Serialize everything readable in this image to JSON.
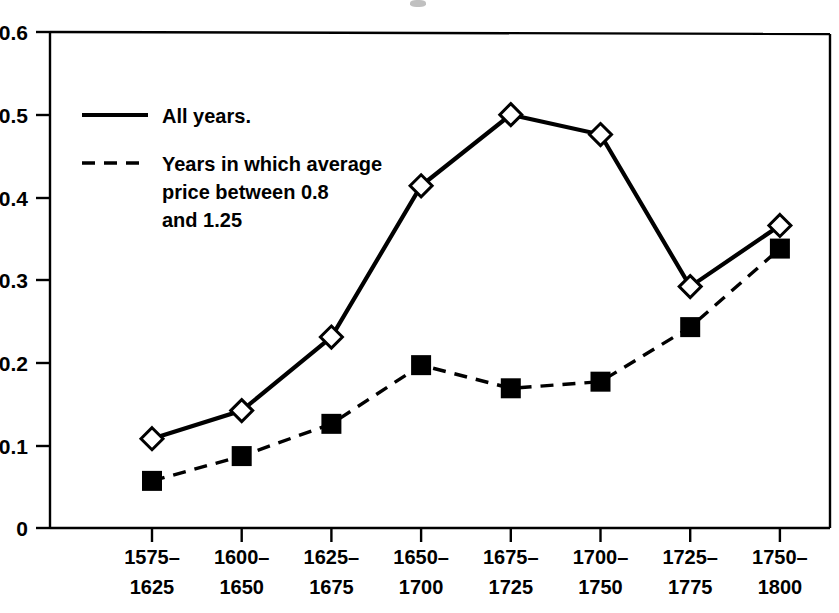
{
  "chart_data": {
    "type": "line",
    "title": "",
    "xlabel": "",
    "ylabel": "",
    "categories": [
      "1575–1625",
      "1600–1650",
      "1625–1675",
      "1650–1700",
      "1675–1725",
      "1700–1750",
      "1725–1775",
      "1750–1800"
    ],
    "category_lines": [
      [
        "1575–",
        "1625"
      ],
      [
        "1600–",
        "1650"
      ],
      [
        "1625–",
        "1675"
      ],
      [
        "1650–",
        "1700"
      ],
      [
        "1675–",
        "1725"
      ],
      [
        "1700–",
        "1750"
      ],
      [
        "1725–",
        "1775"
      ],
      [
        "1750–",
        "1800"
      ]
    ],
    "series": [
      {
        "name": "All years.",
        "linestyle": "solid",
        "marker": "open-diamond",
        "color": "#000000",
        "values": [
          0.108,
          0.142,
          0.231,
          0.414,
          0.5,
          0.476,
          0.292,
          0.366
        ]
      },
      {
        "name": "Years in which average price between 0.8 and 1.25",
        "linestyle": "dashed",
        "marker": "filled-square",
        "color": "#000000",
        "values": [
          0.057,
          0.087,
          0.126,
          0.197,
          0.169,
          0.177,
          0.243,
          0.338
        ]
      }
    ],
    "ylim": [
      0,
      0.6
    ],
    "yticks": [
      0,
      0.1,
      0.2,
      0.3,
      0.4,
      0.5,
      0.6
    ],
    "ytick_labels": [
      "0",
      "0.1",
      "0.2",
      "0.3",
      "0.4",
      "0.5",
      "0.6"
    ],
    "grid": false,
    "legend_position": "upper-left-inside"
  },
  "legend": {
    "entries": [
      {
        "label_lines": [
          "All years."
        ],
        "style": "solid"
      },
      {
        "label_lines": [
          "Years in which average",
          "price between 0.8",
          "and 1.25"
        ],
        "style": "dashed"
      }
    ]
  },
  "colors": {
    "ink": "#000000",
    "background": "#ffffff"
  }
}
